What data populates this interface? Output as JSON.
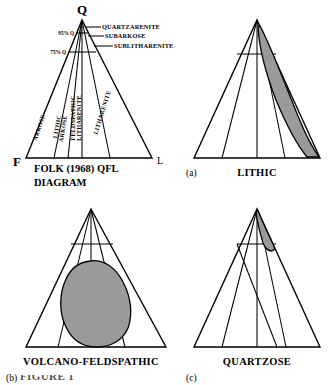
{
  "figure": {
    "caption_partial": "FIGURE 1",
    "gray_fill": "#9a9a9a",
    "line_color": "#000000",
    "background": "#ffffff"
  },
  "panels": [
    {
      "id": "folk",
      "tag": "",
      "title": "",
      "caption_line1": "FOLK (1968) QFL",
      "caption_line2": "DIAGRAM",
      "vertices": {
        "apex": "Q",
        "left": "F",
        "right": "L"
      },
      "percent_labels": [
        {
          "text": "95% Q"
        },
        {
          "text": "75% Q"
        }
      ],
      "callouts": [
        {
          "text": "QUARTZARENITE"
        },
        {
          "text": "SUBARKOSE"
        },
        {
          "text": "SUBLITHARENITE"
        }
      ],
      "sector_labels": [
        {
          "line1": "ARKOSE",
          "line2": ""
        },
        {
          "line1": "LITHIC",
          "line2": "ARKOSE"
        },
        {
          "line1": "FELDSPATHIC",
          "line2": "LITHARENITE"
        },
        {
          "line1": "LITHARENITE",
          "line2": ""
        }
      ]
    },
    {
      "id": "a",
      "tag": "(a)",
      "title": "LITHIC",
      "field_shape": "crescent-right-limb"
    },
    {
      "id": "b",
      "tag": "(b)",
      "title": "VOLCANO-FELDSPATHIC",
      "field_shape": "central-blob"
    },
    {
      "id": "c",
      "tag": "(c)",
      "title": "QUARTZOSE",
      "field_shape": "apex-sliver"
    }
  ]
}
